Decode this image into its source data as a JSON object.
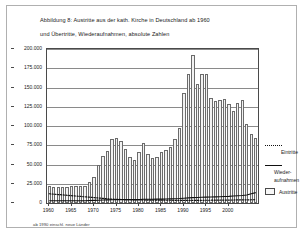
{
  "figure": {
    "title_line1": "Abbildung 8: Austritte aus der kath. Kirche in Deutschland ab 1960",
    "title_line2": "und Übertritte, Wiederaufnahmen, absolute Zahlen",
    "footnote": "ab 1990 einschl. neue Länder"
  },
  "legend": {
    "eintritte_label": "Eintritte",
    "wieder_label_line1": "Wieder-",
    "wieder_label_line2": "aufnahmen",
    "austritte_label": "Austritte"
  },
  "chart_data": {
    "type": "bar",
    "title": "Abbildung 8: Austritte aus der kath. Kirche in Deutschland ab 1960",
    "subtitle": "und Übertritte, Wiederaufnahmen, absolute Zahlen",
    "xlabel": "",
    "ylabel": "",
    "ylim": [
      0,
      200000
    ],
    "ytick_values": [
      0,
      25000,
      50000,
      75000,
      100000,
      125000,
      150000,
      175000,
      200000
    ],
    "ytick_labels": [
      "0",
      "25.000",
      "50.000",
      "75.000",
      "100.000",
      "125.000",
      "150.000",
      "175.000",
      "200.000"
    ],
    "grid": true,
    "legend_position": "right",
    "xtick_values": [
      1960,
      1965,
      1970,
      1975,
      1980,
      1985,
      1990,
      1995,
      2000
    ],
    "xtick_labels": [
      "1960",
      "1965",
      "1970",
      "1975",
      "1980",
      "1985",
      "1990",
      "1995",
      "2000"
    ],
    "categories": [
      1960,
      1961,
      1962,
      1963,
      1964,
      1965,
      1966,
      1967,
      1968,
      1969,
      1970,
      1971,
      1972,
      1973,
      1974,
      1975,
      1976,
      1977,
      1978,
      1979,
      1980,
      1981,
      1982,
      1983,
      1984,
      1985,
      1986,
      1987,
      1988,
      1989,
      1990,
      1991,
      1992,
      1993,
      1994,
      1995,
      1996,
      1997,
      1998,
      1999,
      2000,
      2001,
      2002,
      2003,
      2004,
      2005,
      2006
    ],
    "series": [
      {
        "name": "Austritte",
        "type": "bar",
        "values": [
          22000,
          21000,
          21000,
          21000,
          21000,
          22000,
          22000,
          22000,
          22000,
          27000,
          34000,
          49000,
          61000,
          68000,
          83000,
          84000,
          81000,
          70000,
          60000,
          56000,
          66000,
          78000,
          64000,
          59000,
          60000,
          66000,
          69000,
          73000,
          83000,
          97000,
          143000,
          167000,
          192000,
          155000,
          168000,
          168000,
          136000,
          132000,
          134000,
          135000,
          129000,
          120000,
          130000,
          134000,
          102000,
          89000,
          84000
        ]
      },
      {
        "name": "Eintritte",
        "type": "line",
        "style": "dotted",
        "values": [
          12000,
          11500,
          11000,
          10500,
          10000,
          9500,
          9000,
          8500,
          8000,
          7500,
          7000,
          6500,
          6000,
          5500,
          5000,
          4800,
          4600,
          4400,
          4200,
          4000,
          4000,
          3900,
          3800,
          3800,
          3700,
          3700,
          3600,
          3600,
          3500,
          3500,
          3500,
          3400,
          3400,
          3500,
          3500,
          3600,
          3600,
          3700,
          3700,
          3800,
          3800,
          3900,
          4000,
          4100,
          4100,
          4200,
          4300
        ]
      },
      {
        "name": "Wiederaufnahmen",
        "type": "line",
        "style": "solid",
        "values": [
          3000,
          3000,
          3000,
          3000,
          3000,
          3000,
          3000,
          3000,
          3000,
          3200,
          3400,
          3600,
          3800,
          4000,
          4200,
          4400,
          4400,
          4400,
          4400,
          4400,
          4600,
          4800,
          4800,
          4800,
          5000,
          5000,
          5200,
          5400,
          5600,
          5800,
          6200,
          6600,
          7000,
          7200,
          7400,
          7600,
          7800,
          8000,
          8200,
          8400,
          8600,
          9000,
          9400,
          9800,
          10400,
          12000,
          13500
        ]
      }
    ]
  }
}
